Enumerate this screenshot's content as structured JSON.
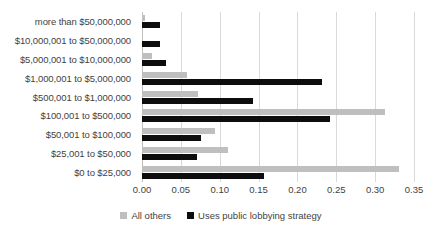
{
  "chart_data": {
    "type": "bar",
    "orientation": "horizontal",
    "title": "",
    "xlabel": "",
    "ylabel": "",
    "xlim": [
      0.0,
      0.35
    ],
    "xticks": [
      "0.00",
      "0.05",
      "0.10",
      "0.15",
      "0.20",
      "0.25",
      "0.30",
      "0.35"
    ],
    "xtick_values": [
      0.0,
      0.05,
      0.1,
      0.15,
      0.2,
      0.25,
      0.3,
      0.35
    ],
    "grid": true,
    "legend_position": "bottom",
    "categories": [
      "more than $50,000,000",
      "$10,000,001 to $50,000,000",
      "$5,000,001 to $10,000,000",
      "$1,000,001 to $5,000,000",
      "$500,001 to $1,000,000",
      "$100,001 to $500,000",
      "$50,001 to $100,000",
      "$25,001 to $50,000",
      "$0 to $25,000"
    ],
    "series": [
      {
        "name": "All others",
        "color": "#bfbfbf",
        "values": [
          0.004,
          0.0,
          0.013,
          0.058,
          0.072,
          0.313,
          0.094,
          0.111,
          0.331
        ]
      },
      {
        "name": "Uses public lobbying strategy",
        "color": "#0d0d0d",
        "values": [
          0.023,
          0.023,
          0.031,
          0.232,
          0.143,
          0.242,
          0.076,
          0.071,
          0.157
        ]
      }
    ]
  }
}
